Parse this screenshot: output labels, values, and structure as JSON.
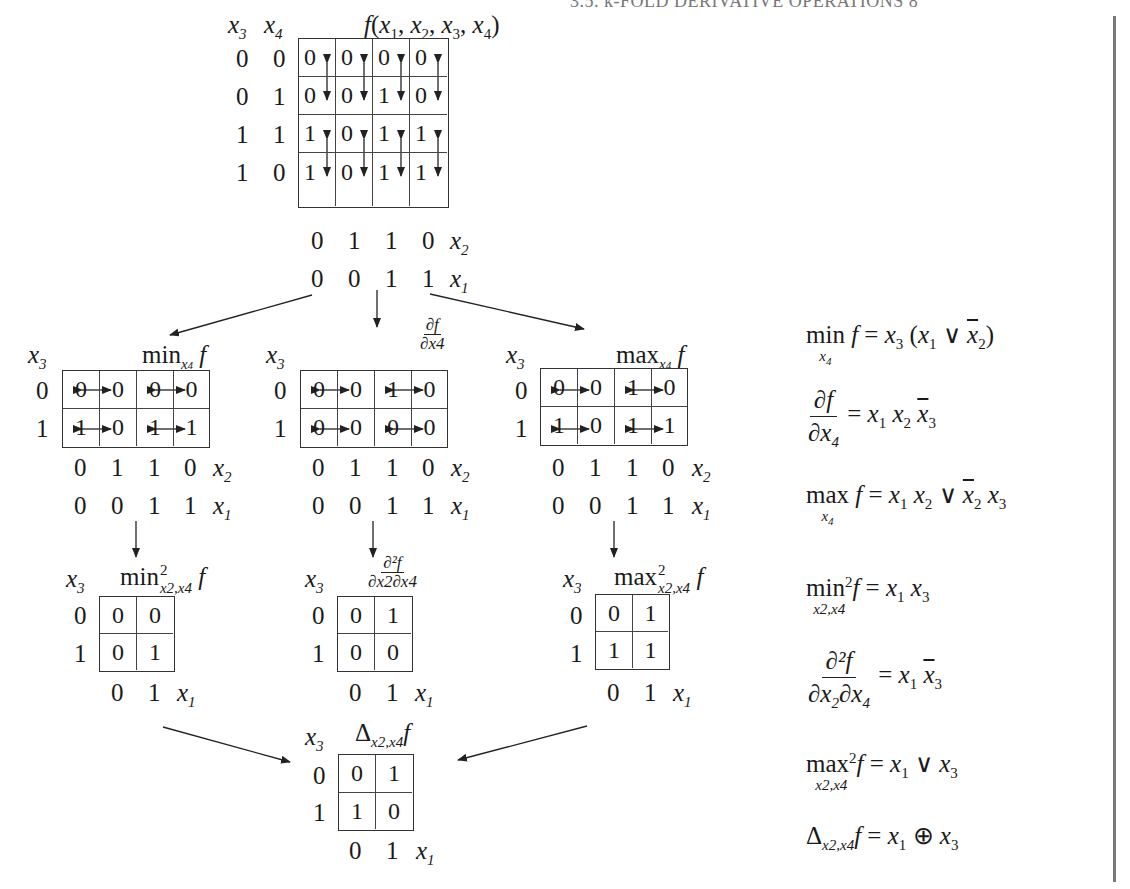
{
  "header": {
    "running_title": "3.5. k-FOLD DERIVATIVE OPERATIONS   8"
  },
  "main_map": {
    "title": "f(x1, x2, x3, x4)",
    "row_var_labels": [
      "x3",
      "x4"
    ],
    "row_labels": [
      [
        "0",
        "0"
      ],
      [
        "0",
        "1"
      ],
      [
        "1",
        "1"
      ],
      [
        "1",
        "0"
      ]
    ],
    "col_labels_x2": [
      "0",
      "1",
      "1",
      "0"
    ],
    "col_labels_x1": [
      "0",
      "0",
      "1",
      "1"
    ],
    "x2_label": "x2",
    "x1_label": "x1",
    "cells": [
      [
        "0",
        "0",
        "0",
        "0"
      ],
      [
        "0",
        "0",
        "1",
        "0"
      ],
      [
        "1",
        "0",
        "1",
        "1"
      ],
      [
        "1",
        "0",
        "1",
        "1"
      ]
    ]
  },
  "level1_maps": [
    {
      "id": "min",
      "title_op": "min",
      "title_sub": "x4",
      "title_fn": "f",
      "row_var": "x3",
      "row_labels": [
        "0",
        "1"
      ],
      "cells": [
        [
          "0",
          "0",
          "0",
          "0"
        ],
        [
          "1",
          "0",
          "1",
          "1"
        ]
      ],
      "col_labels_x2": [
        "0",
        "1",
        "1",
        "0"
      ],
      "col_labels_x1": [
        "0",
        "0",
        "1",
        "1"
      ]
    },
    {
      "id": "derivative",
      "title_num": "∂f",
      "title_den": "∂x4",
      "row_var": "x3",
      "row_labels": [
        "0",
        "1"
      ],
      "cells": [
        [
          "0",
          "0",
          "1",
          "0"
        ],
        [
          "0",
          "0",
          "0",
          "0"
        ]
      ],
      "col_labels_x2": [
        "0",
        "1",
        "1",
        "0"
      ],
      "col_labels_x1": [
        "0",
        "0",
        "1",
        "1"
      ]
    },
    {
      "id": "max",
      "title_op": "max",
      "title_sub": "x4",
      "title_fn": "f",
      "row_var": "x3",
      "row_labels": [
        "0",
        "1"
      ],
      "cells": [
        [
          "0",
          "0",
          "1",
          "0"
        ],
        [
          "1",
          "0",
          "1",
          "1"
        ]
      ],
      "col_labels_x2": [
        "0",
        "1",
        "1",
        "0"
      ],
      "col_labels_x1": [
        "0",
        "0",
        "1",
        "1"
      ]
    }
  ],
  "level2_maps": [
    {
      "id": "min2",
      "title_op": "min",
      "title_sup": "2",
      "title_sub": "x2,x4",
      "title_fn": "f",
      "row_var": "x3",
      "row_labels": [
        "0",
        "1"
      ],
      "cells": [
        [
          "0",
          "0"
        ],
        [
          "0",
          "1"
        ]
      ],
      "col_labels": [
        "0",
        "1"
      ],
      "col_var": "x1"
    },
    {
      "id": "derivative2",
      "title_num": "∂²f",
      "title_den": "∂x2∂x4",
      "row_var": "x3",
      "row_labels": [
        "0",
        "1"
      ],
      "cells": [
        [
          "0",
          "1"
        ],
        [
          "0",
          "0"
        ]
      ],
      "col_labels": [
        "0",
        "1"
      ],
      "col_var": "x1"
    },
    {
      "id": "max2",
      "title_op": "max",
      "title_sup": "2",
      "title_sub": "x2,x4",
      "title_fn": "f",
      "row_var": "x3",
      "row_labels": [
        "0",
        "1"
      ],
      "cells": [
        [
          "0",
          "1"
        ],
        [
          "1",
          "1"
        ]
      ],
      "col_labels": [
        "0",
        "1"
      ],
      "col_var": "x1"
    }
  ],
  "delta_map": {
    "title_op": "Δ",
    "title_sub": "x2,x4",
    "title_fn": "f",
    "row_var": "x3",
    "row_labels": [
      "0",
      "1"
    ],
    "cells": [
      [
        "0",
        "1"
      ],
      [
        "1",
        "0"
      ]
    ],
    "col_labels": [
      "0",
      "1"
    ],
    "col_var": "x1"
  },
  "formulas": [
    {
      "id": "min_f",
      "lhs": "min_{x4} f",
      "rhs": "x3 (x1 ∨ ¬x2)"
    },
    {
      "id": "df_dx4",
      "lhs": "∂f/∂x4",
      "rhs": "x1 x2 ¬x3"
    },
    {
      "id": "max_f",
      "lhs": "max_{x4} f",
      "rhs": "x1 x2 ∨ ¬x2 x3"
    },
    {
      "id": "min2_f",
      "lhs": "min²_{x2,x4} f",
      "rhs": "x1 x3"
    },
    {
      "id": "d2f",
      "lhs": "∂²f/∂x2∂x4",
      "rhs": "x1 ¬x3"
    },
    {
      "id": "max2_f",
      "lhs": "max²_{x2,x4} f",
      "rhs": "x1 ∨ x3"
    },
    {
      "id": "delta_f",
      "lhs": "Δ_{x2,x4} f",
      "rhs": "x1 ⊕ x3"
    }
  ],
  "text": {
    "x": "x",
    "f": "f",
    "eq": "=",
    "or": "∨",
    "xor": "⊕",
    "lp": "(",
    "rp": ")",
    "min": "min",
    "max": "max",
    "delta": "Δ",
    "partial_f": "∂f",
    "partial2_f": "∂²f",
    "n1": "1",
    "n2": "2",
    "n3": "3",
    "n4": "4",
    "comma": ",",
    "sub24": "x2,x4",
    "sup2": "2"
  }
}
